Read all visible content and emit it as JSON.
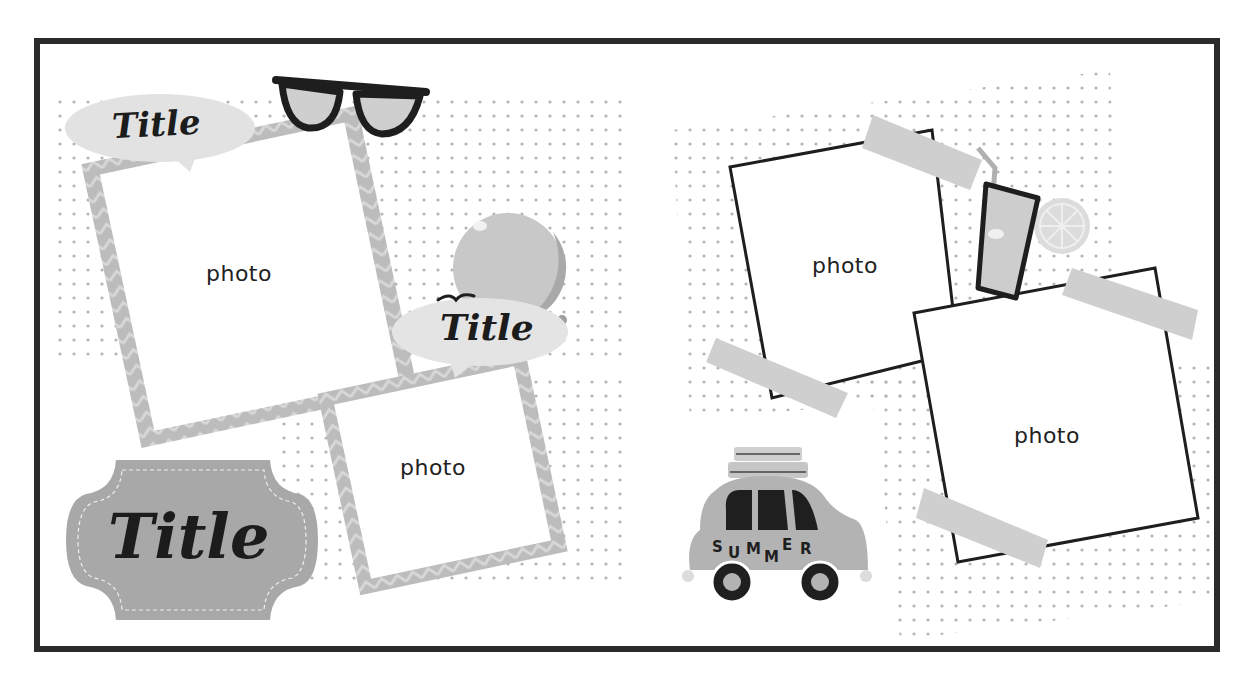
{
  "page": {
    "type": "scrapbook photo album template",
    "theme": "summer",
    "colors": {
      "border": "#2b2b2b",
      "dots": "#b5b5b5",
      "zigzag_frame": "#bdbdbd",
      "tape": "#cfcfcf",
      "label_plate": "#a8a8a8",
      "ink": "#1c1c1c"
    }
  },
  "left_spread": {
    "title_bubble_top": {
      "text": "Title"
    },
    "title_bubble_mid": {
      "text": "Title"
    },
    "title_plate": {
      "text": "Title"
    },
    "photo_large": {
      "label": "photo"
    },
    "photo_small": {
      "label": "photo"
    },
    "stickers": [
      "sunglasses-icon",
      "beach-ball-icon",
      "bird-icon"
    ]
  },
  "right_spread": {
    "photo_top": {
      "label": "photo"
    },
    "photo_bottom": {
      "label": "photo"
    },
    "car_sticker": {
      "letters": [
        "S",
        "U",
        "M",
        "M",
        "E",
        "R"
      ]
    },
    "stickers": [
      "lemonade-glass-icon",
      "lemon-slice-icon",
      "car-icon",
      "washi-tape"
    ]
  }
}
